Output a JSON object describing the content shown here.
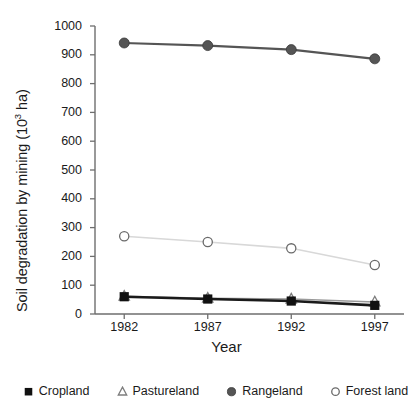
{
  "chart_data": {
    "type": "line",
    "title": "",
    "xlabel": "Year",
    "ylabel": "Soil degradation by mining (10",
    "ylabel_sup": "3",
    "ylabel_tail": " ha)",
    "categories": [
      "1982",
      "1987",
      "1992",
      "1997"
    ],
    "x": [
      1982,
      1987,
      1992,
      1997
    ],
    "xlim": [
      1980.25,
      1998.75
    ],
    "ylim": [
      0,
      1000
    ],
    "yticks": [
      0,
      100,
      200,
      300,
      400,
      500,
      600,
      700,
      800,
      900,
      1000
    ],
    "ytick_labels": [
      "0",
      "100",
      "200",
      "300",
      "400",
      "500",
      "600",
      "700",
      "800",
      "900",
      "1000"
    ],
    "grid": false,
    "legend_position": "bottom",
    "series": [
      {
        "name": "Cropland",
        "marker": "filled-square",
        "color": "#1a1a1a",
        "values": [
          60,
          52,
          45,
          30
        ]
      },
      {
        "name": "Pastureland",
        "marker": "open-triangle",
        "color": "#9a9a9a",
        "values": [
          62,
          55,
          52,
          42
        ]
      },
      {
        "name": "Rangeland",
        "marker": "filled-circle",
        "color": "#555555",
        "values": [
          941,
          932,
          918,
          886
        ]
      },
      {
        "name": "Forest land",
        "marker": "open-circle",
        "color": "#d8d8d8",
        "values": [
          270,
          250,
          228,
          170
        ]
      }
    ]
  },
  "legend": {
    "items": [
      {
        "label": "Cropland",
        "marker": "filled-square"
      },
      {
        "label": "Pastureland",
        "marker": "open-triangle"
      },
      {
        "label": "Rangeland",
        "marker": "filled-circle"
      },
      {
        "label": "Forest land",
        "marker": "open-circle"
      }
    ]
  }
}
